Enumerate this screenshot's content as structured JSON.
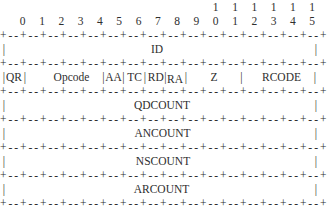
{
  "diagram": {
    "background": "#ffffff",
    "ink": "#2e2e2e",
    "bit_ruler": {
      "tens": [
        "1",
        "1",
        "1",
        "1",
        "1",
        "1"
      ],
      "units": [
        "0",
        "1",
        "2",
        "3",
        "4",
        "5",
        "6",
        "7",
        "8",
        "9",
        "0",
        "1",
        "2",
        "3",
        "4",
        "5"
      ]
    },
    "separator": {
      "cell": "+--",
      "end": "+",
      "cells": 16
    },
    "vertical_bar": "|",
    "rows": [
      {
        "kind": "full",
        "label": "ID"
      },
      {
        "kind": "flags",
        "fields": [
          "QR",
          "Opcode",
          "AA",
          "TC",
          "RD",
          "RA",
          "Z",
          "RCODE"
        ]
      },
      {
        "kind": "full",
        "label": "QDCOUNT"
      },
      {
        "kind": "full",
        "label": "ANCOUNT"
      },
      {
        "kind": "full",
        "label": "NSCOUNT"
      },
      {
        "kind": "full",
        "label": "ARCOUNT"
      }
    ]
  }
}
